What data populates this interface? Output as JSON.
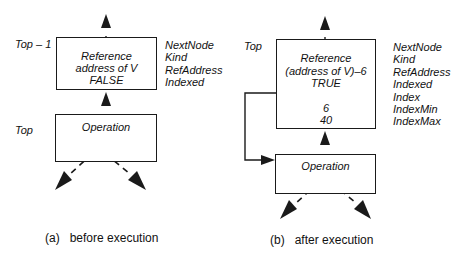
{
  "panel_a": {
    "caption_label": "(a)",
    "caption_text": "before execution",
    "top_stack_label": "Top – 1",
    "bottom_stack_label": "Top",
    "reference_box": {
      "line1": "Reference",
      "line2": "address of V",
      "line3": "FALSE"
    },
    "operation_box": {
      "label": "Operation"
    },
    "fields": [
      "NextNode",
      "Kind",
      "RefAddress",
      "Indexed"
    ]
  },
  "panel_b": {
    "caption_label": "(b)",
    "caption_text": "after execution",
    "top_stack_label": "Top",
    "reference_box": {
      "line1": "Reference",
      "line2": "(address of V)–6",
      "line3": "TRUE",
      "index_min": "6",
      "index_max": "40"
    },
    "operation_box": {
      "label": "Operation"
    },
    "fields": [
      "NextNode",
      "Kind",
      "RefAddress",
      "Indexed",
      "Index",
      "IndexMin",
      "IndexMax"
    ]
  },
  "colors": {
    "line": "#1a1a1a",
    "background": "#ffffff"
  }
}
